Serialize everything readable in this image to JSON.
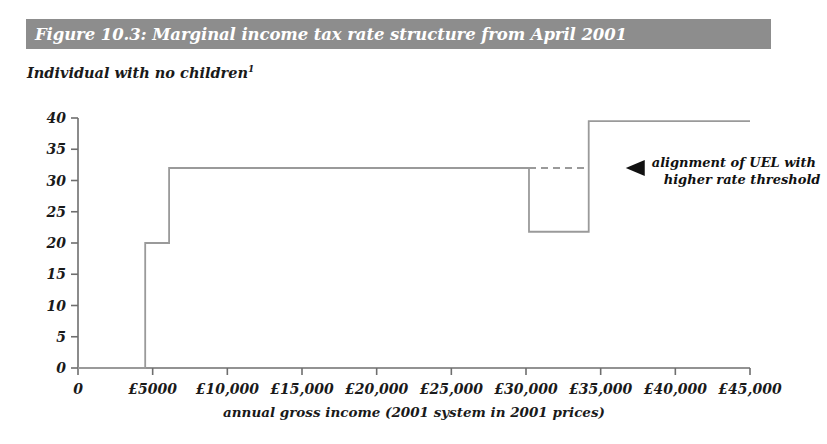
{
  "header": {
    "title": "Figure 10.3: Marginal income tax rate structure from April 2001",
    "bar_color": "#8d8d8d",
    "text_color": "#ffffff"
  },
  "subtitle": {
    "text": "Individual with no children",
    "footnote_marker": "1"
  },
  "annotation": {
    "marker": "triangle-left",
    "line1": "alignment of UEL with",
    "line2": "higher rate threshold"
  },
  "chart_data": {
    "type": "line",
    "title": "Figure 10.3: Marginal income tax rate structure from April 2001",
    "subtitle": "Individual with no children",
    "xlabel": "annual gross income (2001 system in 2001 prices)",
    "ylabel": "",
    "xlim": [
      0,
      45000
    ],
    "ylim": [
      0,
      40
    ],
    "grid": false,
    "legend": "none",
    "line_color": "#9a9a9a",
    "axis_color": "#6e6e6e",
    "x_tick_values": [
      0,
      5000,
      10000,
      15000,
      20000,
      25000,
      30000,
      35000,
      40000,
      45000
    ],
    "x_tick_labels": [
      "0",
      "£5000",
      "£10,000",
      "£15,000",
      "£20,000",
      "£25,000",
      "£30,000",
      "£35,000",
      "£40,000",
      "£45,000"
    ],
    "y_tick_values": [
      0,
      5,
      10,
      15,
      20,
      25,
      30,
      35,
      40
    ],
    "y_tick_labels": [
      "0",
      "5",
      "10",
      "15",
      "20",
      "25",
      "30",
      "35",
      "40"
    ],
    "series": [
      {
        "name": "marginal income tax rate",
        "style": "step",
        "x": [
          0,
          4500,
          4500,
          6100,
          6100,
          30200,
          30200,
          34200,
          34200,
          45000
        ],
        "values": [
          0,
          0,
          20,
          20,
          32,
          32,
          21.8,
          21.8,
          39.5,
          39.5
        ]
      },
      {
        "name": "UEL alignment reference",
        "style": "step-dashed",
        "x": [
          30200,
          34200
        ],
        "values": [
          32,
          32
        ]
      }
    ],
    "steps": [
      {
        "from": 0,
        "to": 4500,
        "rate": 0
      },
      {
        "from": 4500,
        "to": 6100,
        "rate": 20
      },
      {
        "from": 6100,
        "to": 30200,
        "rate": 32
      },
      {
        "from": 30200,
        "to": 34200,
        "rate": 21.8
      },
      {
        "from": 34200,
        "to": 45000,
        "rate": 39.5
      }
    ],
    "annotations": [
      {
        "text": "alignment of UEL with higher rate threshold",
        "x": 34200,
        "y": 32
      }
    ]
  }
}
